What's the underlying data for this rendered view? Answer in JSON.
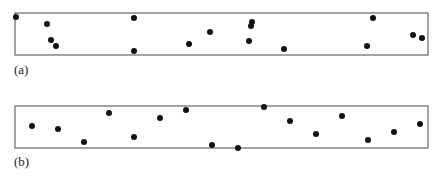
{
  "panels": [
    {
      "label": "(a)",
      "box": {
        "x": 15,
        "y": 13,
        "w": 413,
        "h": 42
      },
      "label_pos": {
        "x": 14,
        "y": 62
      },
      "points": [
        [
          16,
          17
        ],
        [
          47,
          24
        ],
        [
          51,
          40
        ],
        [
          56,
          46
        ],
        [
          134,
          18
        ],
        [
          134,
          51
        ],
        [
          189,
          44
        ],
        [
          210,
          32
        ],
        [
          252,
          22
        ],
        [
          251,
          26
        ],
        [
          249,
          41
        ],
        [
          284,
          49
        ],
        [
          373,
          18
        ],
        [
          367,
          46
        ],
        [
          413,
          35
        ],
        [
          422,
          38
        ]
      ]
    },
    {
      "label": "(b)",
      "box": {
        "x": 15,
        "y": 106,
        "w": 413,
        "h": 42
      },
      "label_pos": {
        "x": 14,
        "y": 154
      },
      "points": [
        [
          32,
          126
        ],
        [
          58,
          129
        ],
        [
          84,
          142
        ],
        [
          109,
          113
        ],
        [
          134,
          137
        ],
        [
          160,
          118
        ],
        [
          186,
          110
        ],
        [
          212,
          145
        ],
        [
          238,
          148
        ],
        [
          264,
          107
        ],
        [
          290,
          121
        ],
        [
          316,
          134
        ],
        [
          342,
          116
        ],
        [
          368,
          140
        ],
        [
          394,
          132
        ],
        [
          420,
          124
        ]
      ]
    }
  ],
  "style": {
    "dot_color": "#111111",
    "box_color": "#666666",
    "dot_radius": 3
  }
}
